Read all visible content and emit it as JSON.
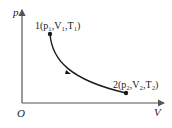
{
  "diagram": {
    "type": "p-V diagram",
    "axes": {
      "y_label": "p",
      "x_label": "V",
      "origin_label": "O"
    },
    "points": [
      {
        "id": "1",
        "label": "1(p₁,V₁,T₁)",
        "x": 50,
        "y": 34
      },
      {
        "id": "2",
        "label": "2(p₂,V₂,T₂)",
        "x": 126,
        "y": 93
      }
    ],
    "process": {
      "from": "1",
      "to": "2",
      "curve": "hyperbola-like (isothermal)",
      "direction_arrow": "from 1 toward 2"
    },
    "colors": {
      "axis": "#555555",
      "curve": "#1a1a1a",
      "text": "#222222"
    }
  }
}
